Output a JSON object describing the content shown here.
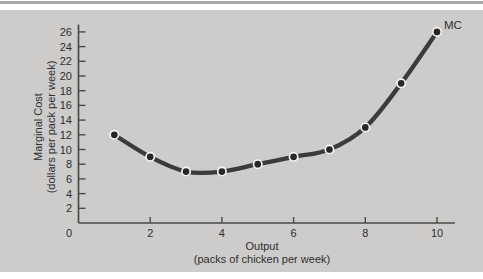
{
  "figure": {
    "curve_label": "MC",
    "x_title_line1": "Output",
    "x_title_line2": "(packs of chicken per week)",
    "y_title_line1": "Marginal Cost",
    "y_title_line2": "(dollars per pack per week)",
    "origin_label": "0"
  },
  "colors": {
    "top_rule": "#a9a9a7",
    "panel_bg": "#cdccca",
    "axis": "#4a4a48",
    "tick_text": "#2e2e2e",
    "curve": "#3b3b3b",
    "point_fill": "#272727",
    "point_ring": "#f4f3f1"
  },
  "chart_data": {
    "type": "line",
    "title": "",
    "xlabel": "Output (packs of chicken per week)",
    "ylabel": "Marginal Cost (dollars per pack per week)",
    "series": [
      {
        "name": "MC",
        "x": [
          1,
          2,
          3,
          4,
          5,
          6,
          7,
          8,
          9,
          10
        ],
        "y": [
          12,
          9,
          7,
          7,
          8,
          9,
          10,
          13,
          19,
          26
        ]
      }
    ],
    "x_ticks": [
      2,
      4,
      6,
      8,
      10
    ],
    "y_ticks": [
      2,
      4,
      6,
      8,
      10,
      12,
      14,
      16,
      18,
      20,
      22,
      24,
      26
    ],
    "xlim": [
      0,
      10.5
    ],
    "ylim": [
      0,
      27
    ],
    "grid": false,
    "legend": "curve label at last data point"
  }
}
